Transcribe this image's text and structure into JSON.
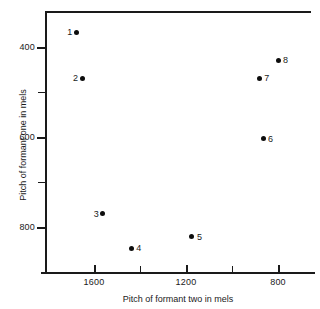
{
  "chart_data": {
    "type": "scatter",
    "title": "",
    "xlabel": "Pitch of formant two in mels",
    "ylabel": "Pitch of formant one in mels",
    "x_ticks_major": [
      1600,
      1200,
      800
    ],
    "x_ticks_minor": [
      1400,
      1000
    ],
    "y_ticks_major": [
      400,
      600,
      800
    ],
    "y_ticks_minor": [
      500,
      700
    ],
    "xlim": [
      1780,
      740
    ],
    "ylim": [
      880,
      310
    ],
    "x_axis_inverted": true,
    "y_axis_inverted": true,
    "grid": false,
    "legend": "none",
    "points": [
      {
        "label": "1",
        "x": 1677,
        "y": 367,
        "label_side": "left"
      },
      {
        "label": "2",
        "x": 1652,
        "y": 469,
        "label_side": "left"
      },
      {
        "label": "3",
        "x": 1562,
        "y": 771,
        "label_side": "left"
      },
      {
        "label": "4",
        "x": 1438,
        "y": 847,
        "label_side": "right"
      },
      {
        "label": "5",
        "x": 1174,
        "y": 822,
        "label_side": "right"
      },
      {
        "label": "6",
        "x": 865,
        "y": 604,
        "label_side": "right"
      },
      {
        "label": "7",
        "x": 882,
        "y": 469,
        "label_side": "right"
      },
      {
        "label": "8",
        "x": 800,
        "y": 429,
        "label_side": "right"
      }
    ]
  },
  "axes": {
    "x_tick_labels": [
      "1600",
      "1200",
      "800"
    ],
    "y_tick_labels": [
      "400",
      "600",
      "800"
    ],
    "x_title": "Pitch of formant two in mels",
    "y_title": "Pitch of formant one in mels"
  },
  "colors": {
    "axis": "#1a1a1a",
    "marker": "#0d0d0d",
    "background": "#ffffff"
  }
}
